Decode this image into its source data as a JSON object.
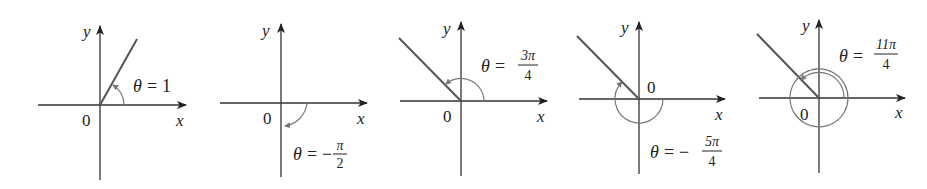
{
  "figure": {
    "panels": [
      {
        "id": "theta-1",
        "axis_x_label": "x",
        "axis_y_label": "y",
        "origin_label": "0",
        "theta_symbol": "θ",
        "equals": "=",
        "value": "1",
        "sign": "",
        "numerator": "",
        "denominator": ""
      },
      {
        "id": "theta-neg-pi-over-2",
        "axis_x_label": "x",
        "axis_y_label": "y",
        "origin_label": "0",
        "theta_symbol": "θ",
        "equals": "=",
        "sign": "−",
        "numerator": "π",
        "denominator": "2"
      },
      {
        "id": "theta-3pi-over-4",
        "axis_x_label": "x",
        "axis_y_label": "y",
        "origin_label": "0",
        "theta_symbol": "θ",
        "equals": "=",
        "sign": "",
        "numerator": "3π",
        "denominator": "4"
      },
      {
        "id": "theta-neg-5pi-over-4",
        "axis_x_label": "x",
        "axis_y_label": "y",
        "origin_label": "0",
        "theta_symbol": "θ",
        "equals": "=",
        "sign": "−",
        "numerator": "5π",
        "denominator": "4"
      },
      {
        "id": "theta-11pi-over-4",
        "axis_x_label": "x",
        "axis_y_label": "y",
        "origin_label": "0",
        "theta_symbol": "θ",
        "equals": "=",
        "sign": "",
        "numerator": "11π",
        "denominator": "4"
      }
    ]
  }
}
